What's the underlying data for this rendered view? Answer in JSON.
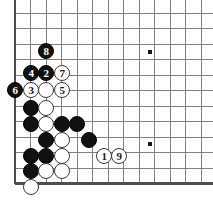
{
  "diagram": {
    "kind": "go-board-diagram",
    "board_size": 19,
    "view": "bottom-left-corner",
    "colors": {
      "background": "#ffffff",
      "grid_line": "#808080",
      "border_line": "#4d4d4d",
      "black_stone": "#111111",
      "white_stone": "#ffffff",
      "star_point": "#1a1a1a"
    },
    "geometry": {
      "origin_x": 15,
      "origin_y": 13,
      "spacing": 15.5,
      "cols_visible": 13,
      "rows_visible": 12,
      "stone_radius": 8
    },
    "star_points": [
      {
        "name": "star-point-upper",
        "x": 150,
        "y": 52
      },
      {
        "name": "star-point-lower",
        "x": 150,
        "y": 144
      }
    ],
    "move_sequence": [
      {
        "number": "1",
        "color": "white",
        "x": 104,
        "y": 156
      },
      {
        "number": "2",
        "color": "black",
        "x": 46,
        "y": 73
      },
      {
        "number": "3",
        "color": "white",
        "x": 31,
        "y": 90
      },
      {
        "number": "4",
        "color": "black",
        "x": 31,
        "y": 73
      },
      {
        "number": "5",
        "color": "white",
        "x": 62,
        "y": 90
      },
      {
        "number": "6",
        "color": "black",
        "x": 15,
        "y": 90
      },
      {
        "number": "7",
        "color": "white",
        "x": 62,
        "y": 73
      },
      {
        "number": "8",
        "color": "black",
        "x": 46,
        "y": 51
      },
      {
        "number": "9",
        "color": "white",
        "x": 119,
        "y": 156
      }
    ],
    "plain_stones": [
      {
        "color": "white",
        "x": 46,
        "y": 90
      },
      {
        "color": "black",
        "x": 31,
        "y": 108
      },
      {
        "color": "white",
        "x": 46,
        "y": 108
      },
      {
        "color": "black",
        "x": 31,
        "y": 124
      },
      {
        "color": "white",
        "x": 46,
        "y": 124
      },
      {
        "color": "black",
        "x": 62,
        "y": 124
      },
      {
        "color": "black",
        "x": 77,
        "y": 124
      },
      {
        "color": "black",
        "x": 46,
        "y": 140
      },
      {
        "color": "white",
        "x": 62,
        "y": 140
      },
      {
        "color": "black",
        "x": 89,
        "y": 140
      },
      {
        "color": "black",
        "x": 31,
        "y": 156
      },
      {
        "color": "black",
        "x": 46,
        "y": 156
      },
      {
        "color": "white",
        "x": 62,
        "y": 156
      },
      {
        "color": "black",
        "x": 31,
        "y": 171
      },
      {
        "color": "white",
        "x": 46,
        "y": 171
      },
      {
        "color": "white",
        "x": 62,
        "y": 171
      },
      {
        "color": "white",
        "x": 31,
        "y": 187
      }
    ]
  }
}
